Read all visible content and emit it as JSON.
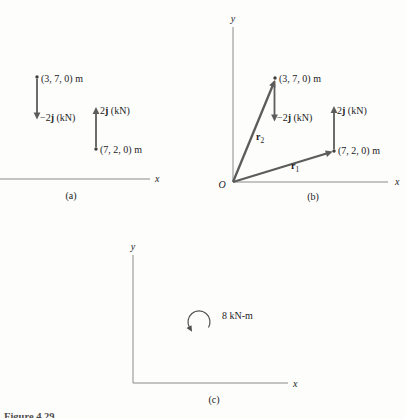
{
  "colors": {
    "vector_gray": "#5c5c5c",
    "axis_gray": "#8a8a8a",
    "arc_gray": "#4f4f4f",
    "text": "#1c1c1c",
    "background": "#fdfdfc"
  },
  "panels": {
    "a": {
      "caption": "(a)",
      "x_label": "x",
      "point_top": "(3, 7, 0) m",
      "point_bottom": "(7, 2, 0) m",
      "force_down": {
        "prefix": "−2",
        "vector": "j",
        "suffix": " (kN)"
      },
      "force_up": {
        "prefix": "2",
        "vector": "j",
        "suffix": " (kN)"
      }
    },
    "b": {
      "caption": "(b)",
      "x_label": "x",
      "y_label": "y",
      "origin": "O",
      "point_top": "(3, 7, 0) m",
      "point_right": "(7, 2, 0) m",
      "force_down": {
        "prefix": "−2",
        "vector": "j",
        "suffix": " (kN)"
      },
      "force_up": {
        "prefix": "2",
        "vector": "j",
        "suffix": " (kN)"
      },
      "r1": {
        "symbol": "r",
        "subscript": "1"
      },
      "r2": {
        "symbol": "r",
        "subscript": "2"
      }
    },
    "c": {
      "caption": "(c)",
      "x_label": "x",
      "y_label": "y",
      "moment": "8 kN-m"
    }
  },
  "figure_caption": "Figure 4.29"
}
